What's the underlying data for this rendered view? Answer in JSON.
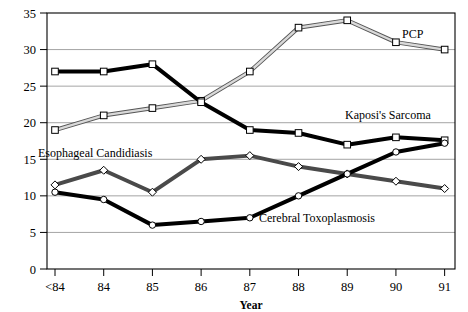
{
  "chart_data": {
    "type": "line",
    "title": "",
    "xlabel": "Year",
    "ylabel": "",
    "categories": [
      "<84",
      "84",
      "85",
      "86",
      "87",
      "88",
      "89",
      "90",
      "91"
    ],
    "ylim": [
      0,
      35
    ],
    "yticks": [
      0,
      5,
      10,
      15,
      20,
      25,
      30,
      35
    ],
    "grid": "horizontal",
    "legend": "inline-annotations",
    "series": [
      {
        "name": "PCP",
        "values": [
          19,
          21,
          22,
          23,
          27,
          33,
          34,
          31,
          30
        ],
        "color": "#d9d9d9",
        "outline": "#555555",
        "marker": "square",
        "label_x": 402,
        "label_y": 38
      },
      {
        "name": "Kaposi's Sarcoma",
        "values": [
          27,
          27,
          28,
          22.8,
          19,
          18.6,
          17,
          18,
          17.6
        ],
        "color": "#000000",
        "outline": "#000000",
        "marker": "square",
        "label_x": 345,
        "label_y": 119
      },
      {
        "name": "Esophageal Candidiasis",
        "values": [
          11.5,
          13.5,
          10.5,
          15,
          15.5,
          14,
          13,
          12,
          11
        ],
        "color": "#4a4a4a",
        "outline": "#4a4a4a",
        "marker": "diamond",
        "label_x": 38,
        "label_y": 157
      },
      {
        "name": "Cerebral Toxoplasmosis",
        "values": [
          10.5,
          9.5,
          6,
          6.5,
          7,
          10,
          13,
          16,
          17.2
        ],
        "color": "#000000",
        "outline": "#000000",
        "marker": "circle",
        "label_x": 259,
        "label_y": 222
      }
    ]
  },
  "axis": {
    "x_tick_labels": [
      "<84",
      "84",
      "85",
      "86",
      "87",
      "88",
      "89",
      "90",
      "91"
    ],
    "y_tick_labels": [
      "0",
      "5",
      "10",
      "15",
      "20",
      "25",
      "30",
      "35"
    ],
    "x_axis_title": "Year"
  },
  "series_labels": {
    "pcp": "PCP",
    "kaposis_sarcoma": "Kaposi's Sarcoma",
    "esophageal_candidiasis": "Esophageal Candidiasis",
    "cerebral_toxoplasmosis": "Cerebral Toxoplasmosis"
  },
  "colors": {
    "background": "#ffffff",
    "frame": "#000000",
    "gridline": "#8d8d8d",
    "text": "#000000"
  }
}
